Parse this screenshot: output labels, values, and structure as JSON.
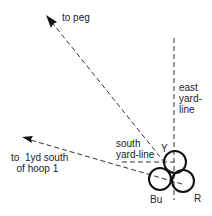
{
  "diagram": {
    "type": "croquet-shot-diagram",
    "colors": {
      "line": "#333333",
      "ball_stroke": "#111111",
      "text": "#222222",
      "background": "#ffffff"
    },
    "labels": {
      "to_peg": "to peg",
      "east_yard_line": "east\nyard-\nline",
      "south_yard_line": "south\nyard-line",
      "hoop1": "to  1yd south\n  of hoop 1",
      "ball_y": "Y",
      "ball_bu": "Bu",
      "ball_r": "R"
    },
    "balls": [
      {
        "id": "Y",
        "cx": 175,
        "cy": 162,
        "r": 11
      },
      {
        "id": "Bu",
        "cx": 160,
        "cy": 179,
        "r": 11
      },
      {
        "id": "R",
        "cx": 183,
        "cy": 181,
        "r": 11
      }
    ],
    "lines": {
      "east_yard_line": {
        "x1": 174,
        "y1": 38,
        "x2": 174,
        "y2": 200
      },
      "south_yard_line": {
        "x1": 122,
        "y1": 162,
        "x2": 174,
        "y2": 162
      },
      "to_peg": {
        "x1": 165,
        "y1": 163,
        "x2": 50,
        "y2": 20
      },
      "to_hoop1": {
        "x1": 182,
        "y1": 184,
        "x2": 26,
        "y2": 138
      }
    }
  }
}
